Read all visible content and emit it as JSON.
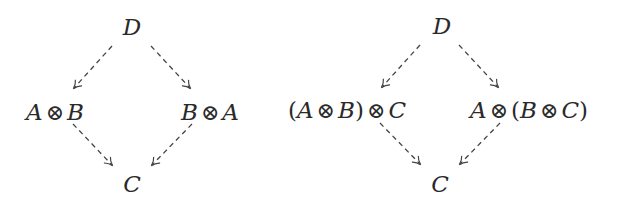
{
  "diagrams": [
    {
      "name": "braiding-diagram",
      "nodes": {
        "top": {
          "label": "D",
          "x": 132,
          "y": 27
        },
        "left": {
          "label": "A ⊗ B",
          "parts": [
            "A",
            "⊗",
            "B"
          ],
          "x": 55,
          "y": 112
        },
        "right": {
          "label": "B ⊗ A",
          "parts": [
            "B",
            "⊗",
            "A"
          ],
          "x": 210,
          "y": 112
        },
        "bottom": {
          "label": "C",
          "x": 132,
          "y": 184
        }
      },
      "arrows": [
        {
          "from": "top",
          "to": "left",
          "style": "dashed"
        },
        {
          "from": "top",
          "to": "right",
          "style": "dashed"
        },
        {
          "from": "left",
          "to": "bottom",
          "style": "dashed"
        },
        {
          "from": "right",
          "to": "bottom",
          "style": "dashed"
        }
      ]
    },
    {
      "name": "associator-diagram",
      "nodes": {
        "top": {
          "label": "D",
          "x": 442,
          "y": 26
        },
        "left": {
          "label": "(A ⊗ B) ⊗ C",
          "parts": [
            "(",
            "A",
            "⊗",
            "B",
            ")",
            "⊗",
            "C"
          ],
          "x": 347,
          "y": 110
        },
        "right": {
          "label": "A ⊗ (B ⊗ C)",
          "parts": [
            "A",
            "⊗",
            "(",
            "B",
            "⊗",
            "C",
            ")"
          ],
          "x": 529,
          "y": 110
        },
        "bottom": {
          "label": "C",
          "x": 440,
          "y": 184
        }
      },
      "arrows": [
        {
          "from": "top",
          "to": "left",
          "style": "dashed"
        },
        {
          "from": "top",
          "to": "right",
          "style": "dashed"
        },
        {
          "from": "left",
          "to": "bottom",
          "style": "dashed"
        },
        {
          "from": "right",
          "to": "bottom",
          "style": "dashed"
        }
      ]
    }
  ],
  "colors": {
    "ink": "#2a2a2a",
    "arrow": "#444444",
    "background": "#ffffff"
  }
}
